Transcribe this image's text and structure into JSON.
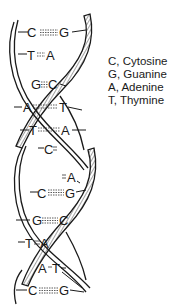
{
  "diagram": {
    "base_pairs": [
      {
        "left": "C",
        "right": "G",
        "y": 32,
        "lx": 32,
        "rx": 63,
        "bond": "triple"
      },
      {
        "left": "T",
        "right": "A",
        "y": 55,
        "lx": 31,
        "rx": 50,
        "bond": "double"
      },
      {
        "left": "G",
        "right": "C",
        "y": 84,
        "lx": 35,
        "rx": 52,
        "bond": "triple"
      },
      {
        "left": "A",
        "right": "T",
        "y": 107,
        "lx": 27,
        "rx": 63,
        "bond": "double"
      },
      {
        "left": "T",
        "right": "A",
        "y": 130,
        "lx": 33,
        "rx": 66,
        "bond": "double"
      },
      {
        "left": "C",
        "right": "G",
        "y": 149,
        "lx": 48,
        "rx": 60,
        "bond": "triple"
      },
      {
        "left": "T",
        "right": "A",
        "y": 177,
        "lx": 62,
        "rx": 71,
        "bond": "double"
      },
      {
        "left": "C",
        "right": "G",
        "y": 193,
        "lx": 42,
        "rx": 70,
        "bond": "triple"
      },
      {
        "left": "G",
        "right": "C",
        "y": 220,
        "lx": 36,
        "rx": 64,
        "bond": "triple"
      },
      {
        "left": "T",
        "right": "A",
        "y": 243,
        "lx": 28,
        "rx": 44,
        "bond": "double"
      },
      {
        "left": "A",
        "right": "T",
        "y": 268,
        "lx": 42,
        "rx": 56,
        "bond": "double"
      },
      {
        "left": "C",
        "right": "G",
        "y": 290,
        "lx": 32,
        "rx": 63,
        "bond": "triple"
      }
    ],
    "strand_color": "#1a1a1a",
    "background": "#ffffff"
  },
  "legend": {
    "items": [
      {
        "label": "C, Cytosine"
      },
      {
        "label": "G, Guanine"
      },
      {
        "label": "A, Adenine"
      },
      {
        "label": "T, Thymine"
      }
    ]
  }
}
